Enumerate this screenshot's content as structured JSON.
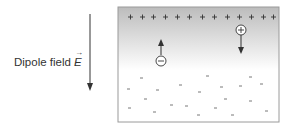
{
  "diagram": {
    "field_label": "Dipole field",
    "field_symbol": "E",
    "field_direction": "down",
    "colors": {
      "box_border": "#9a9a9a",
      "gradient_top": "#bdbdbd",
      "gradient_bottom": "#ffffff",
      "ink": "#333333"
    },
    "positive_layer": {
      "symbol": "+",
      "count": 13
    },
    "charges": [
      {
        "sign": "-",
        "label": "electron",
        "motion": "up"
      },
      {
        "sign": "+",
        "label": "hole",
        "motion": "down"
      }
    ],
    "negative_ions": {
      "symbol": "-",
      "count": 21
    }
  }
}
